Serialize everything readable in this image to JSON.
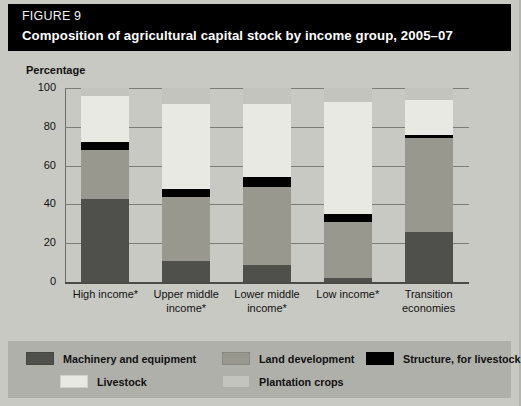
{
  "header": {
    "figure_label": "FIGURE 9",
    "title": "Composition of agricultural capital stock by income group, 2005–07"
  },
  "axis": {
    "ylabel": "Percentage",
    "yticks": [
      "100",
      "80",
      "60",
      "40",
      "20",
      "0"
    ]
  },
  "legend": {
    "items": [
      {
        "label": "Machinery and equipment",
        "color": "#4f4f4c"
      },
      {
        "label": "Land development",
        "color": "#98988f"
      },
      {
        "label": "Structure, for livestock",
        "color": "#000000"
      },
      {
        "label": "Livestock",
        "color": "#e9e9e4"
      },
      {
        "label": "Plantation crops",
        "color": "#c4c4be"
      }
    ]
  },
  "chart_data": {
    "type": "bar",
    "subtype": "stacked-100",
    "title": "Composition of agricultural capital stock by income group, 2005–07",
    "xlabel": "",
    "ylabel": "Percentage",
    "ylim": [
      0,
      100
    ],
    "yticks": [
      0,
      20,
      40,
      60,
      80,
      100
    ],
    "grid": true,
    "legend_position": "bottom",
    "categories": [
      "High income*",
      "Upper middle income*",
      "Lower middle income*",
      "Low income*",
      "Transition economies"
    ],
    "series": [
      {
        "name": "Machinery and equipment",
        "color": "#4f4f4c",
        "values": [
          43,
          11,
          9,
          2,
          26
        ]
      },
      {
        "name": "Land development",
        "color": "#98988f",
        "values": [
          25,
          33,
          40,
          29,
          48
        ]
      },
      {
        "name": "Structure, for livestock",
        "color": "#000000",
        "values": [
          4,
          4,
          5,
          4,
          2
        ]
      },
      {
        "name": "Livestock",
        "color": "#e9e9e4",
        "values": [
          24,
          44,
          38,
          58,
          18
        ]
      },
      {
        "name": "Plantation crops",
        "color": "#c4c4be",
        "values": [
          4,
          8,
          8,
          7,
          6
        ]
      }
    ]
  }
}
